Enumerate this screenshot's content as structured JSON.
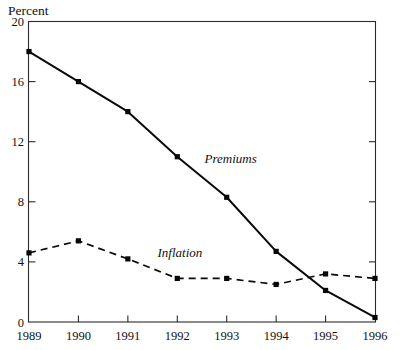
{
  "chart_data": {
    "type": "line",
    "title": "",
    "xlabel": "",
    "ylabel": "Percent",
    "categories": [
      "1989",
      "1990",
      "1991",
      "1992",
      "1993",
      "1994",
      "1995",
      "1996"
    ],
    "x": [
      1989,
      1990,
      1991,
      1992,
      1993,
      1994,
      1995,
      1996
    ],
    "xlim": [
      1989,
      1996
    ],
    "ylim": [
      0,
      20
    ],
    "yticks": [
      0,
      4,
      8,
      12,
      16,
      20
    ],
    "ytick_labels": [
      "0",
      "4",
      "8",
      "12",
      "16",
      "20"
    ],
    "xtick_labels": [
      "1989",
      "1990",
      "1991",
      "1992",
      "1993",
      "1994",
      "1995",
      "1996"
    ],
    "grid": false,
    "legend": "inline-annotations",
    "series": [
      {
        "name": "Premiums",
        "style": "solid",
        "marker": "filled-square",
        "color": "#0a0a0a",
        "values": [
          18.0,
          16.0,
          14.0,
          11.0,
          8.3,
          4.7,
          2.1,
          0.3
        ]
      },
      {
        "name": "Inflation",
        "style": "dashed",
        "marker": "filled-square",
        "color": "#0a0a0a",
        "values": [
          4.6,
          5.4,
          4.2,
          2.9,
          2.9,
          2.5,
          3.2,
          2.9
        ]
      }
    ],
    "annotations": [
      {
        "text": "Premiums",
        "x": 1992.55,
        "y": 10.6
      },
      {
        "text": "Inflation",
        "x": 1991.6,
        "y": 4.35
      }
    ]
  }
}
